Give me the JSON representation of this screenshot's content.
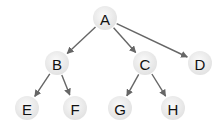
{
  "diagram": {
    "type": "tree",
    "colors": {
      "node_fill_center": "#fafafa",
      "node_fill_edge": "#e2e2e2",
      "edge": "#666666",
      "label": "#111111"
    },
    "node_radius": 12,
    "nodes": [
      {
        "id": "A",
        "label": "A",
        "x": 105,
        "y": 18
      },
      {
        "id": "B",
        "label": "B",
        "x": 57,
        "y": 63
      },
      {
        "id": "C",
        "label": "C",
        "x": 145,
        "y": 63
      },
      {
        "id": "D",
        "label": "D",
        "x": 200,
        "y": 63
      },
      {
        "id": "E",
        "label": "E",
        "x": 27,
        "y": 108
      },
      {
        "id": "F",
        "label": "F",
        "x": 75,
        "y": 108
      },
      {
        "id": "G",
        "label": "G",
        "x": 120,
        "y": 108
      },
      {
        "id": "H",
        "label": "H",
        "x": 173,
        "y": 108
      }
    ],
    "edges": [
      {
        "from": "A",
        "to": "B"
      },
      {
        "from": "A",
        "to": "C"
      },
      {
        "from": "A",
        "to": "D"
      },
      {
        "from": "B",
        "to": "E"
      },
      {
        "from": "B",
        "to": "F"
      },
      {
        "from": "C",
        "to": "G"
      },
      {
        "from": "C",
        "to": "H"
      }
    ]
  }
}
